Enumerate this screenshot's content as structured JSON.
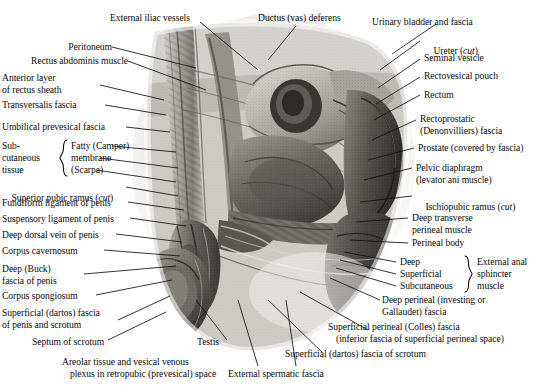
{
  "plate": {
    "title": "Male pelvis, median sagittal section — fascial planes",
    "ink_color": "#0a0a0a",
    "background_color": "#ffffff",
    "image_type": "grayscale halftone anatomical illustration"
  },
  "labels": {
    "external_iliac_vessels": "External iliac vessels",
    "ductus_vas_deferens": "Ductus (vas) deferens",
    "urinary_bladder_and_fascia": "Urinary bladder and fascia",
    "ureter": "Ureter (",
    "ureter_italic": "cut",
    "ureter_end": ")",
    "peritoneum": "Peritoneum",
    "seminal_vesicle": "Seminal vesicle",
    "rectus_abdominis_muscle": "Rectus abdominis muscle",
    "rectovesical_pouch": "Rectovesical pouch",
    "anterior_layer_1": "Anterior layer",
    "anterior_layer_2": "of rectus sheath",
    "rectum": "Rectum",
    "transversalis_fascia": "Transversalis fascia",
    "rectoprostatic_1": "Rectoprostatic",
    "rectoprostatic_2": "(Denonvilliers) fascia",
    "umbilical_prevesical_fascia": "Umbilical prevesical fascia",
    "subcutaneous_1": "Sub-",
    "subcutaneous_2": "cutaneous",
    "subcutaneous_3": "tissue",
    "fatty_camper": "Fatty (Camper)",
    "membrane": "membrane",
    "scarpa": "(Scarpa)",
    "prostate": "Prostate (covered by fascia)",
    "pelvic_diaphragm_1": "Pelvic diaphragm",
    "pelvic_diaphragm_2": "(levator ani muscle)",
    "superior_pubic_ramus": "Superior pubic ramus (",
    "superior_pubic_ramus_italic": "cut",
    "superior_pubic_ramus_end": ")",
    "ischiopubic_ramus": "Ischiopubic ramus (",
    "ischiopubic_ramus_italic": "cut",
    "ischiopubic_ramus_end": ")",
    "fundiform_ligament": "Fundiform ligament of penis",
    "suspensory_ligament": "Suspensory ligament of penis",
    "deep_transverse_1": "Deep transverse",
    "deep_transverse_2": "perineal muscle",
    "deep_dorsal_vein": "Deep dorsal vein of penis",
    "perineal_body": "Perineal body",
    "corpus_cavernosum": "Corpus cavernosum",
    "deep": "Deep",
    "external_anal_1": "External anal",
    "deep_buck_1": "Deep (Buck)",
    "deep_buck_2": "fascia of penis",
    "superficial": "Superficial",
    "external_anal_2": "sphincter",
    "corpus_spongiosum": "Corpus spongiosum",
    "subcutaneous_eas": "Subcutaneous",
    "external_anal_3": "muscle",
    "superficial_dartos_penis_1": "Superficial (dartos) fascia",
    "superficial_dartos_penis_2": "of penis and scrotum",
    "deep_perineal_1": "Deep perineal (investing or",
    "deep_perineal_2": "Gallaudet) fascia",
    "septum_of_scrotum": "Septum of scrotum",
    "testis": "Testis",
    "superficial_perineal_1": "Superficial perineal (Colles) fascia",
    "superficial_perineal_2": "(inferior fascia of superficial perineal space)",
    "areolar_1": "Areolar tissue and vesical venous",
    "areolar_2": "plexus in retropubic (prevesical) space",
    "superficial_dartos_scrotum": "Superficial (dartos) fascia of scrotum",
    "external_spermatic_fascia": "External spermatic fascia"
  },
  "braces": {
    "subcutaneous_tissue_brace": "left-curly-brace",
    "external_anal_sphincter_brace": "right-curly-brace"
  },
  "structures_depicted": [
    "external iliac vessels",
    "peritoneum",
    "rectus abdominis muscle",
    "anterior layer of rectus sheath",
    "transversalis fascia",
    "umbilical prevesical fascia",
    "fatty (Camper) layer of subcutaneous tissue",
    "membranous (Scarpa) layer of subcutaneous tissue",
    "superior pubic ramus",
    "fundiform ligament of penis",
    "suspensory ligament of penis",
    "deep dorsal vein of penis",
    "corpus cavernosum",
    "deep (Buck) fascia of penis",
    "corpus spongiosum",
    "superficial (dartos) fascia of penis and scrotum",
    "septum of scrotum",
    "testis",
    "external spermatic fascia",
    "ductus (vas) deferens",
    "urinary bladder and fascia",
    "ureter",
    "seminal vesicle",
    "rectovesical pouch",
    "rectum",
    "rectoprostatic (Denonvilliers) fascia",
    "prostate",
    "pelvic diaphragm (levator ani muscle)",
    "ischiopubic ramus",
    "deep transverse perineal muscle",
    "perineal body",
    "external anal sphincter muscle",
    "deep perineal (Gallaudet) fascia",
    "superficial perineal (Colles) fascia",
    "areolar tissue and vesical venous plexus"
  ]
}
